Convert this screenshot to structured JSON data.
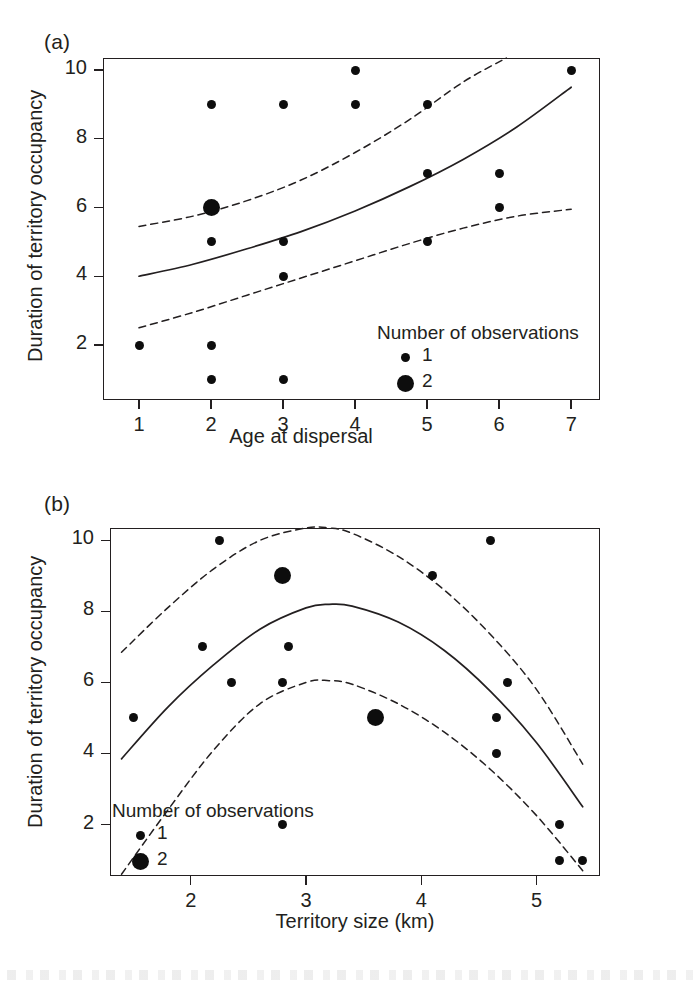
{
  "figure": {
    "panels": [
      {
        "id": "a",
        "label": "(a)",
        "ylabel": "Duration of territory occupancy",
        "xlabel": "Age at dispersal",
        "legend": {
          "title": "Number of observations",
          "entries": [
            {
              "value": "1",
              "size": "small"
            },
            {
              "value": "2",
              "size": "large"
            }
          ]
        }
      },
      {
        "id": "b",
        "label": "(b)",
        "ylabel": "Duration of territory occupancy",
        "xlabel": "Territory size (km)",
        "legend": {
          "title": "Number of observations",
          "entries": [
            {
              "value": "1",
              "size": "small"
            },
            {
              "value": "2",
              "size": "large"
            }
          ]
        }
      }
    ]
  },
  "chart_data": [
    {
      "type": "scatter",
      "panel": "a",
      "title": "(a)",
      "xlabel": "Age at dispersal",
      "ylabel": "Duration of territory occupancy",
      "xlim": [
        0.5,
        7.4
      ],
      "ylim": [
        0.4,
        10.35
      ],
      "xticks": [
        1,
        2,
        3,
        4,
        5,
        6,
        7
      ],
      "xtick_labels": [
        "1",
        "2",
        "3",
        "4",
        "5",
        "6",
        "7"
      ],
      "yticks": [
        2,
        4,
        6,
        8,
        10
      ],
      "ytick_labels": [
        "2",
        "4",
        "6",
        "8",
        "10"
      ],
      "grid": false,
      "legend_position": "lower-right",
      "marker_size_legend": {
        "1": "small",
        "2": "large"
      },
      "points": [
        {
          "x": 1,
          "y": 2,
          "n": 1
        },
        {
          "x": 2,
          "y": 9,
          "n": 1
        },
        {
          "x": 2,
          "y": 6,
          "n": 2
        },
        {
          "x": 2,
          "y": 5,
          "n": 1
        },
        {
          "x": 2,
          "y": 2,
          "n": 1
        },
        {
          "x": 2,
          "y": 1,
          "n": 1
        },
        {
          "x": 3,
          "y": 9,
          "n": 1
        },
        {
          "x": 3,
          "y": 5,
          "n": 1
        },
        {
          "x": 3,
          "y": 4,
          "n": 1
        },
        {
          "x": 3,
          "y": 1,
          "n": 1
        },
        {
          "x": 4,
          "y": 10,
          "n": 1
        },
        {
          "x": 4,
          "y": 9,
          "n": 1
        },
        {
          "x": 5,
          "y": 9,
          "n": 1
        },
        {
          "x": 5,
          "y": 7,
          "n": 1
        },
        {
          "x": 5,
          "y": 5,
          "n": 1
        },
        {
          "x": 6,
          "y": 7,
          "n": 1
        },
        {
          "x": 6,
          "y": 6,
          "n": 1
        },
        {
          "x": 7,
          "y": 10,
          "n": 1
        }
      ],
      "series": [
        {
          "name": "fitted-curve",
          "style": "solid",
          "x": [
            1.0,
            1.75,
            2.5,
            3.25,
            4.0,
            4.75,
            5.5,
            6.25,
            7.0
          ],
          "y": [
            4.0,
            4.35,
            4.8,
            5.3,
            5.9,
            6.6,
            7.4,
            8.35,
            9.5
          ]
        },
        {
          "name": "upper-confidence-limit",
          "style": "dashed",
          "x": [
            1.0,
            1.75,
            2.5,
            3.25,
            4.0,
            4.75,
            5.5,
            6.1
          ],
          "y": [
            5.45,
            5.75,
            6.2,
            6.8,
            7.6,
            8.55,
            9.65,
            10.35
          ]
        },
        {
          "name": "lower-confidence-limit",
          "style": "dashed",
          "x": [
            1.0,
            1.75,
            2.5,
            3.25,
            4.0,
            4.75,
            5.5,
            6.25,
            7.0
          ],
          "y": [
            2.5,
            2.95,
            3.45,
            3.95,
            4.45,
            4.95,
            5.4,
            5.75,
            5.95
          ]
        }
      ]
    },
    {
      "type": "scatter",
      "panel": "b",
      "title": "(b)",
      "xlabel": "Territory size (km)",
      "ylabel": "Duration of territory occupancy",
      "xlim": [
        1.3,
        5.55
      ],
      "ylim": [
        0.55,
        10.35
      ],
      "xticks": [
        2,
        3,
        4,
        5
      ],
      "xtick_labels": [
        "2",
        "3",
        "4",
        "5"
      ],
      "yticks": [
        2,
        4,
        6,
        8,
        10
      ],
      "ytick_labels": [
        "2",
        "4",
        "6",
        "8",
        "10"
      ],
      "grid": false,
      "legend_position": "lower-left",
      "marker_size_legend": {
        "1": "small",
        "2": "large"
      },
      "points": [
        {
          "x": 2.25,
          "y": 10,
          "n": 1
        },
        {
          "x": 4.6,
          "y": 10,
          "n": 1
        },
        {
          "x": 2.8,
          "y": 9,
          "n": 2
        },
        {
          "x": 4.1,
          "y": 9,
          "n": 1
        },
        {
          "x": 2.1,
          "y": 7,
          "n": 1
        },
        {
          "x": 2.85,
          "y": 7,
          "n": 1
        },
        {
          "x": 2.35,
          "y": 6,
          "n": 1
        },
        {
          "x": 2.8,
          "y": 6,
          "n": 1
        },
        {
          "x": 4.75,
          "y": 6,
          "n": 1
        },
        {
          "x": 1.5,
          "y": 5,
          "n": 1
        },
        {
          "x": 3.6,
          "y": 5,
          "n": 2
        },
        {
          "x": 4.65,
          "y": 5,
          "n": 1
        },
        {
          "x": 4.65,
          "y": 4,
          "n": 1
        },
        {
          "x": 2.8,
          "y": 2,
          "n": 1
        },
        {
          "x": 5.2,
          "y": 2,
          "n": 1
        },
        {
          "x": 5.2,
          "y": 1,
          "n": 1
        },
        {
          "x": 5.4,
          "y": 1,
          "n": 1
        }
      ],
      "series": [
        {
          "name": "fitted-curve",
          "style": "solid",
          "x": [
            1.4,
            1.8,
            2.2,
            2.6,
            3.0,
            3.2,
            3.4,
            3.8,
            4.2,
            4.6,
            5.0,
            5.4
          ],
          "y": [
            3.85,
            5.3,
            6.5,
            7.5,
            8.1,
            8.2,
            8.15,
            7.7,
            6.9,
            5.75,
            4.3,
            2.5
          ]
        },
        {
          "name": "upper-confidence-limit",
          "style": "dashed",
          "x": [
            1.4,
            1.8,
            2.2,
            2.6,
            3.0,
            3.2,
            3.4,
            3.8,
            4.2,
            4.6,
            5.0,
            5.4
          ],
          "y": [
            6.85,
            8.1,
            9.2,
            10.0,
            10.35,
            10.35,
            10.2,
            9.55,
            8.6,
            7.35,
            5.8,
            3.7
          ]
        },
        {
          "name": "lower-confidence-limit",
          "style": "dashed",
          "x": [
            1.4,
            1.8,
            2.2,
            2.6,
            3.0,
            3.2,
            3.4,
            3.8,
            4.2,
            4.6,
            5.0,
            5.4
          ],
          "y": [
            0.6,
            2.4,
            4.1,
            5.4,
            6.0,
            6.05,
            5.95,
            5.4,
            4.6,
            3.55,
            2.25,
            0.7
          ]
        }
      ]
    }
  ]
}
